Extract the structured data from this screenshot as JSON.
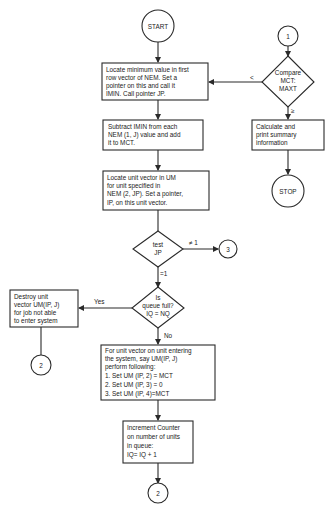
{
  "diagram": {
    "type": "flowchart",
    "connectors": {
      "start": "START",
      "stop": "STOP",
      "c1_top": "1",
      "c3_right": "3",
      "c2_left": "2",
      "c2_bottom": "2"
    },
    "boxes": {
      "locate_min": [
        "Locate minimum value in first",
        "row vector of NEM.  Set a",
        "pointer on this and call it",
        "IMIN.  Call pointer JP."
      ],
      "subtract": [
        "Subtract IMIN from each",
        "NEM (1, J) value and add",
        "it to MCT."
      ],
      "locate_unit": [
        "Locate unit vector in UM",
        "for unit specified in",
        "NEM (2, JP).  Set a pointer,",
        "IP, on this unit vector."
      ],
      "calc_print": [
        "Calculate and",
        "print summary",
        "information"
      ],
      "destroy": [
        "Destroy unit",
        "vector UM(IP, J)",
        "for job not able",
        "to enter system"
      ],
      "unit_entering": [
        "For unit vector on unit entering",
        "the system, say UM(IP, J)",
        "perform following:",
        "1.  Set UM (IP, 2) = MCT",
        "2.  Set UM (IP, 3) = 0",
        "3.  Set UM (IP, 4)=MCT"
      ],
      "increment": [
        "Increment Counter",
        "on number of units",
        "in queue:",
        "IQ= IQ + 1"
      ]
    },
    "decisions": {
      "compare": [
        "Compare",
        "MCT:",
        "MAXT"
      ],
      "test_jp": [
        "test",
        "JP"
      ],
      "queue_full": [
        "Is",
        "queue full?",
        "IQ = NQ"
      ]
    },
    "edge_labels": {
      "compare_less": "<",
      "compare_ge": "≥",
      "test_ne1": "≠ 1",
      "test_eq1": "=1",
      "queue_yes": "Yes",
      "queue_no": "No"
    }
  }
}
